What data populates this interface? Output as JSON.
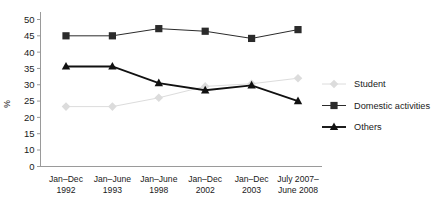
{
  "chart_data": {
    "type": "line",
    "title": "",
    "xlabel": "",
    "ylabel": "%",
    "categories": [
      "Jan–Dec 1992",
      "Jan–June 1993",
      "Jan–June 1998",
      "Jan–Dec 2002",
      "Jan–Dec 2003",
      "July 2007–June 2008"
    ],
    "category_lines": [
      [
        "Jan–Dec",
        "1992"
      ],
      [
        "Jan–June",
        "1993"
      ],
      [
        "Jan–June",
        "1998"
      ],
      [
        "Jan–Dec",
        "2002"
      ],
      [
        "Jan–Dec",
        "2003"
      ],
      [
        "July 2007–",
        "June 2008"
      ]
    ],
    "series": [
      {
        "name": "Student",
        "marker": "diamond",
        "color": "#dcdcdc",
        "values": [
          23.3,
          23.3,
          26.0,
          29.5,
          30.3,
          32.0
        ]
      },
      {
        "name": "Domestic activities",
        "marker": "square",
        "color": "#2b2b2b",
        "values": [
          45.0,
          45.0,
          47.2,
          46.4,
          44.2,
          46.9
        ]
      },
      {
        "name": "Others",
        "marker": "triangle",
        "color": "#111111",
        "values": [
          35.6,
          35.6,
          30.5,
          28.3,
          29.8,
          25.0
        ]
      }
    ],
    "yticks": [
      0,
      10,
      15,
      20,
      25,
      30,
      35,
      40,
      45,
      50
    ],
    "ylim": [
      10,
      50
    ],
    "axis_break": true,
    "grid": false,
    "legend_position": "right"
  },
  "legend": {
    "items": [
      {
        "label": "Student"
      },
      {
        "label": "Domestic activities"
      },
      {
        "label": "Others"
      }
    ]
  },
  "axes": {
    "ylabel": "%",
    "yticks": [
      "50",
      "45",
      "40",
      "35",
      "30",
      "25",
      "20",
      "15",
      "10",
      "0"
    ]
  }
}
